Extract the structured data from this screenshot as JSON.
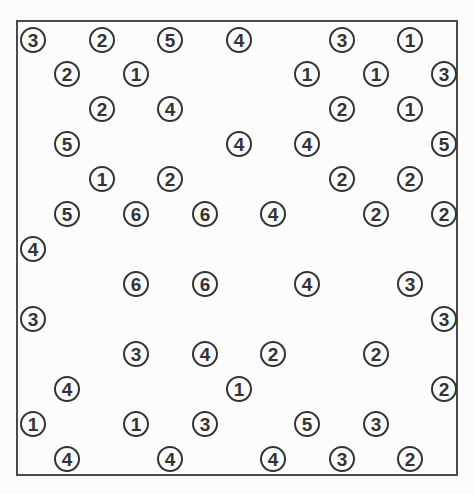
{
  "puzzle": {
    "type": "hashiwokakero",
    "grid_size": {
      "cols": 13,
      "rows": 13
    },
    "colors": {
      "border": "#4a4a4a",
      "island_stroke": "#333333",
      "background": "#fcfcfc"
    },
    "islands": [
      {
        "row": 0,
        "col": 0,
        "value": "3"
      },
      {
        "row": 0,
        "col": 2,
        "value": "2"
      },
      {
        "row": 0,
        "col": 4,
        "value": "5"
      },
      {
        "row": 0,
        "col": 6,
        "value": "4"
      },
      {
        "row": 0,
        "col": 9,
        "value": "3"
      },
      {
        "row": 0,
        "col": 11,
        "value": "1"
      },
      {
        "row": 1,
        "col": 1,
        "value": "2"
      },
      {
        "row": 1,
        "col": 3,
        "value": "1"
      },
      {
        "row": 1,
        "col": 8,
        "value": "1"
      },
      {
        "row": 1,
        "col": 10,
        "value": "1"
      },
      {
        "row": 1,
        "col": 12,
        "value": "3"
      },
      {
        "row": 2,
        "col": 2,
        "value": "2"
      },
      {
        "row": 2,
        "col": 4,
        "value": "4"
      },
      {
        "row": 2,
        "col": 9,
        "value": "2"
      },
      {
        "row": 2,
        "col": 11,
        "value": "1"
      },
      {
        "row": 3,
        "col": 1,
        "value": "5"
      },
      {
        "row": 3,
        "col": 6,
        "value": "4"
      },
      {
        "row": 3,
        "col": 8,
        "value": "4"
      },
      {
        "row": 3,
        "col": 12,
        "value": "5"
      },
      {
        "row": 4,
        "col": 2,
        "value": "1"
      },
      {
        "row": 4,
        "col": 4,
        "value": "2"
      },
      {
        "row": 4,
        "col": 9,
        "value": "2"
      },
      {
        "row": 4,
        "col": 11,
        "value": "2"
      },
      {
        "row": 5,
        "col": 1,
        "value": "5"
      },
      {
        "row": 5,
        "col": 3,
        "value": "6"
      },
      {
        "row": 5,
        "col": 5,
        "value": "6"
      },
      {
        "row": 5,
        "col": 7,
        "value": "4"
      },
      {
        "row": 5,
        "col": 10,
        "value": "2"
      },
      {
        "row": 5,
        "col": 12,
        "value": "2"
      },
      {
        "row": 6,
        "col": 0,
        "value": "4"
      },
      {
        "row": 7,
        "col": 3,
        "value": "6"
      },
      {
        "row": 7,
        "col": 5,
        "value": "6"
      },
      {
        "row": 7,
        "col": 8,
        "value": "4"
      },
      {
        "row": 7,
        "col": 11,
        "value": "3"
      },
      {
        "row": 8,
        "col": 0,
        "value": "3"
      },
      {
        "row": 8,
        "col": 12,
        "value": "3"
      },
      {
        "row": 9,
        "col": 3,
        "value": "3"
      },
      {
        "row": 9,
        "col": 5,
        "value": "4"
      },
      {
        "row": 9,
        "col": 7,
        "value": "2"
      },
      {
        "row": 9,
        "col": 10,
        "value": "2"
      },
      {
        "row": 10,
        "col": 1,
        "value": "4"
      },
      {
        "row": 10,
        "col": 6,
        "value": "1"
      },
      {
        "row": 10,
        "col": 12,
        "value": "2"
      },
      {
        "row": 11,
        "col": 0,
        "value": "1"
      },
      {
        "row": 11,
        "col": 3,
        "value": "1"
      },
      {
        "row": 11,
        "col": 5,
        "value": "3"
      },
      {
        "row": 11,
        "col": 8,
        "value": "5"
      },
      {
        "row": 11,
        "col": 10,
        "value": "3"
      },
      {
        "row": 12,
        "col": 1,
        "value": "4"
      },
      {
        "row": 12,
        "col": 4,
        "value": "4"
      },
      {
        "row": 12,
        "col": 7,
        "value": "4"
      },
      {
        "row": 12,
        "col": 9,
        "value": "3"
      },
      {
        "row": 12,
        "col": 11,
        "value": "2"
      }
    ]
  }
}
